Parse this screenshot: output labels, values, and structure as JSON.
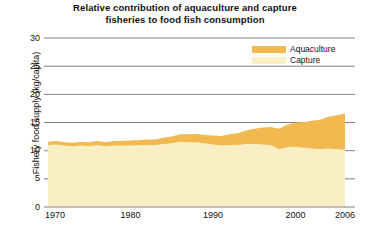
{
  "chart_data": {
    "type": "area",
    "stacked": true,
    "title": "Relative contribution of aquaculture and capture fisheries to food fish consumption",
    "title_lines": [
      "Relative contribution of aquaculture and capture",
      "fisheries to food fish consumption"
    ],
    "xlabel": "",
    "ylabel": "Fishery food supply (kg/capita)",
    "xlim": [
      1970,
      2006
    ],
    "ylim": [
      0,
      30
    ],
    "yticks": [
      0,
      5,
      10,
      15,
      20,
      25,
      30
    ],
    "ytick_labels": [
      "0",
      "5",
      "10",
      "15",
      "20",
      "25",
      "30"
    ],
    "xticks": [
      1970,
      1980,
      1990,
      2000,
      2006
    ],
    "xtick_labels": [
      "1970",
      "1980",
      "1990",
      "2000",
      "2006"
    ],
    "grid": "horizontal",
    "legend_position": "top-right",
    "colors": {
      "aquaculture": "#F2B950",
      "capture": "#FAEFC4",
      "axis": "#808080",
      "grid": "#808080",
      "text": "#111111",
      "background": "#FFFFFF"
    },
    "x": [
      1970,
      1971,
      1972,
      1973,
      1974,
      1975,
      1976,
      1977,
      1978,
      1979,
      1980,
      1981,
      1982,
      1983,
      1984,
      1985,
      1986,
      1987,
      1988,
      1989,
      1990,
      1991,
      1992,
      1993,
      1994,
      1995,
      1996,
      1997,
      1998,
      1999,
      2000,
      2001,
      2002,
      2003,
      2004,
      2005,
      2006
    ],
    "series": [
      {
        "name": "Capture",
        "color": "#FAEFC4",
        "unit": "kg/capita",
        "values": [
          11.0,
          11.1,
          10.9,
          10.8,
          10.9,
          10.8,
          11.0,
          10.8,
          10.9,
          10.9,
          10.9,
          11.0,
          11.0,
          11.0,
          11.2,
          11.3,
          11.6,
          11.5,
          11.5,
          11.3,
          11.1,
          10.9,
          11.0,
          11.0,
          11.2,
          11.2,
          11.1,
          11.0,
          10.3,
          10.6,
          10.7,
          10.5,
          10.4,
          10.3,
          10.4,
          10.3,
          10.1
        ]
      },
      {
        "name": "Aquaculture",
        "color": "#F2B950",
        "unit": "kg/capita",
        "values": [
          0.6,
          0.6,
          0.6,
          0.6,
          0.7,
          0.7,
          0.7,
          0.7,
          0.8,
          0.8,
          0.9,
          0.9,
          1.0,
          1.0,
          1.1,
          1.2,
          1.3,
          1.4,
          1.5,
          1.5,
          1.6,
          1.7,
          1.9,
          2.1,
          2.4,
          2.7,
          3.0,
          3.2,
          3.6,
          4.0,
          4.3,
          4.6,
          4.9,
          5.2,
          5.6,
          6.0,
          6.5
        ]
      }
    ],
    "totals": [
      11.6,
      11.7,
      11.5,
      11.4,
      11.6,
      11.5,
      11.7,
      11.5,
      11.7,
      11.7,
      11.8,
      11.9,
      12.0,
      12.0,
      12.3,
      12.5,
      12.9,
      12.9,
      13.0,
      12.8,
      12.7,
      12.6,
      12.9,
      13.1,
      13.6,
      13.9,
      14.1,
      14.2,
      13.9,
      14.6,
      15.0,
      15.1,
      15.3,
      15.5,
      16.0,
      16.3,
      16.6
    ],
    "legend": [
      {
        "label": "Aquaculture",
        "color": "#F2B950"
      },
      {
        "label": "Capture",
        "color": "#FAEFC4"
      }
    ]
  }
}
